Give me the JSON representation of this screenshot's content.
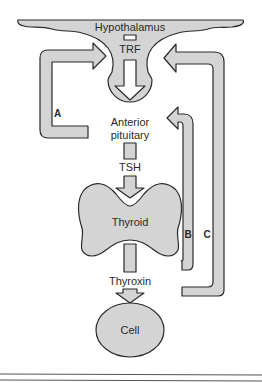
{
  "diagram": {
    "nodes": {
      "hypothalamus": "Hypothalamus",
      "trf": "TRF",
      "anterior_line1": "Anterior",
      "anterior_line2": "pituitary",
      "tsh": "TSH",
      "thyroid": "Thyroid",
      "thyroxin": "Thyroxin",
      "cell": "Cell"
    },
    "loops": {
      "a": "A",
      "b": "B",
      "c": "C"
    },
    "edges": [
      {
        "from": "Hypothalamus",
        "to": "Anterior pituitary",
        "via": "TRF"
      },
      {
        "from": "Anterior pituitary",
        "to": "Thyroid",
        "via": "TSH"
      },
      {
        "from": "Thyroid",
        "to": "Cell",
        "via": "Thyroxin"
      },
      {
        "loop": "A",
        "from": "Anterior pituitary",
        "to": "Hypothalamus"
      },
      {
        "loop": "B",
        "from": "Thyroxin",
        "to": "Anterior pituitary"
      },
      {
        "loop": "C",
        "from": "Thyroxin",
        "to": "Hypothalamus"
      }
    ],
    "colors": {
      "fill": "#d4d4d4",
      "stroke": "#2a2a2a",
      "background": "#ffffff"
    }
  }
}
